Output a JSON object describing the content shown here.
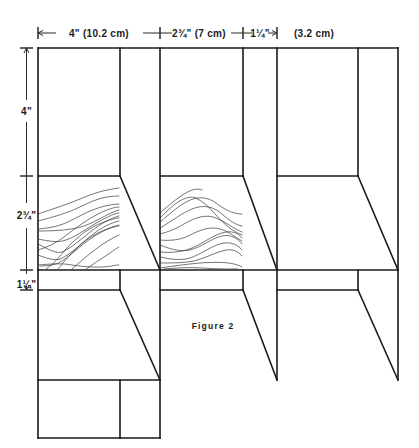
{
  "figure": {
    "caption": "Figure 2",
    "type": "pattern-layout-diagram",
    "units_primary": "inches",
    "units_secondary": "centimeters"
  },
  "horizontal_dimensions": [
    {
      "id": "seg-1",
      "label": "4\" (10.2 cm)",
      "inches": 4,
      "cm": 10.2,
      "x_start": 38,
      "x_end": 160
    },
    {
      "id": "seg-2",
      "label": "2¾\" (7 cm)",
      "inches": 2.75,
      "cm": 7,
      "x_start": 160,
      "x_end": 243
    },
    {
      "id": "seg-3",
      "label": "1¼\"",
      "inches": 1.25,
      "cm": 3.2,
      "x_start": 243,
      "x_end": 277
    },
    {
      "id": "seg-4",
      "label": "(3.2 cm)",
      "inches": 1.25,
      "cm": 3.2,
      "x_start": 277,
      "x_end": 358
    }
  ],
  "vertical_dimensions": [
    {
      "id": "vseg-1",
      "label": "4\"",
      "inches": 4,
      "cm": 10.2,
      "y_start": 48,
      "y_end": 176
    },
    {
      "id": "vseg-2",
      "label": "2¾\"",
      "inches": 2.75,
      "cm": 7,
      "y_start": 176,
      "y_end": 270
    },
    {
      "id": "vseg-3",
      "label": "1¼\"",
      "inches": 1.25,
      "cm": 3.2,
      "y_start": 270,
      "y_end": 290
    }
  ],
  "colors": {
    "ink": "#1a1a1a",
    "dimension": "#2b2b2b",
    "texture": "#3a3a3a",
    "paper": "#ffffff"
  },
  "grid": {
    "vertical_lines_x": [
      38,
      120,
      160,
      243,
      277,
      358,
      398
    ],
    "horizontal_lines_y": [
      48,
      176,
      270,
      290,
      380,
      438
    ]
  },
  "texture_regions": [
    {
      "id": "fur-left",
      "x": 38,
      "y": 178,
      "width": 82,
      "height": 92
    },
    {
      "id": "fur-middle",
      "x": 160,
      "y": 178,
      "width": 83,
      "height": 92
    }
  ]
}
